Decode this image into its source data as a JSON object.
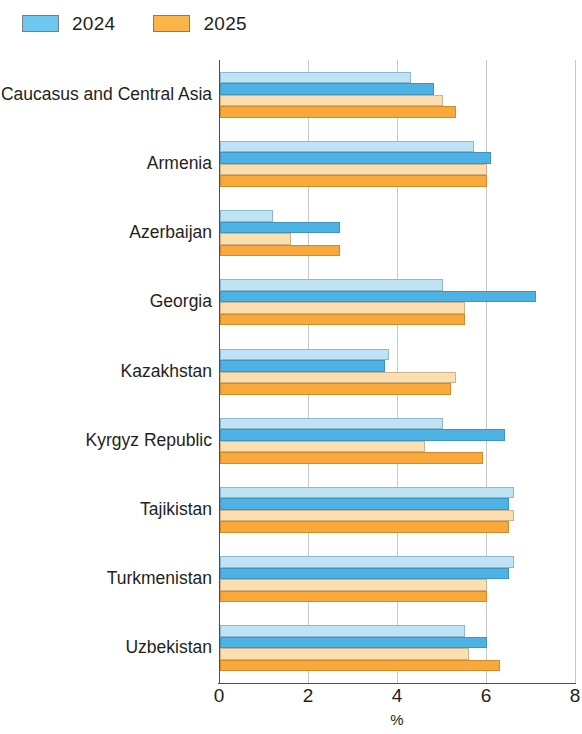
{
  "legend": {
    "items": [
      {
        "label": "2024",
        "color": "#6ec7ef",
        "icon": "legend-swatch-2024"
      },
      {
        "label": "2025",
        "color": "#f9b košt"
      }
    ]
  },
  "axis": {
    "title": "%",
    "ticks": [
      "0",
      "2",
      "4",
      "6",
      "8"
    ],
    "tick_values": [
      0,
      2,
      4,
      6,
      8
    ]
  },
  "chart_data": {
    "type": "bar",
    "orientation": "horizontal",
    "title": "",
    "xlabel": "%",
    "ylabel": "",
    "xlim": [
      0,
      8
    ],
    "grid": true,
    "legend_position": "top-left",
    "categories": [
      "Caucasus and Central Asia",
      "Armenia",
      "Azerbaijan",
      "Georgia",
      "Kazakhstan",
      "Kyrgyz Republic",
      "Tajikistan",
      "Turkmenistan",
      "Uzbekistan"
    ],
    "series": [
      {
        "name": "2024 (light)",
        "key": "blue-light",
        "color": "#bfe3f5",
        "values": [
          4.3,
          5.7,
          1.2,
          5.0,
          3.8,
          5.0,
          6.6,
          6.6,
          5.5
        ]
      },
      {
        "name": "2024",
        "key": "blue-dark",
        "color": "#4eb3e4",
        "values": [
          4.8,
          6.1,
          2.7,
          7.1,
          3.7,
          6.4,
          6.5,
          6.5,
          6.0
        ]
      },
      {
        "name": "2025 (light)",
        "key": "orange-light",
        "color": "#fbdfb0",
        "values": [
          5.0,
          6.0,
          1.6,
          5.5,
          5.3,
          4.6,
          6.6,
          6.0,
          5.6
        ]
      },
      {
        "name": "2025",
        "key": "orange-dark",
        "color": "#f9a93c",
        "values": [
          5.3,
          6.0,
          2.7,
          5.5,
          5.2,
          5.9,
          6.5,
          6.0,
          6.3
        ]
      }
    ]
  }
}
